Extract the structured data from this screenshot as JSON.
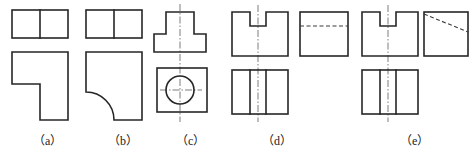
{
  "figure": {
    "background_color": "#ffffff",
    "line_colors": {
      "visible_edge": "#262626",
      "hidden_edge": "#3a3a3a",
      "center_line": "#6e6e6e",
      "label_text": "#1a1a1a"
    },
    "line_types": {
      "visible_edge": "solid thick",
      "hidden_edge": "dashed",
      "center_line": "dash-dot"
    }
  },
  "labels": [
    {
      "id": "a",
      "text": "（a）",
      "x": 33,
      "y": 131
    },
    {
      "id": "b",
      "text": "（b）",
      "x": 108,
      "y": 131
    },
    {
      "id": "c",
      "text": "（c）",
      "x": 176,
      "y": 131
    },
    {
      "id": "d",
      "text": "（d）",
      "x": 262,
      "y": 131
    },
    {
      "id": "e",
      "text": "（e）",
      "x": 400,
      "y": 131
    }
  ],
  "problems": [
    {
      "id": "a",
      "label": "（a）",
      "views": [
        {
          "name": "top-view",
          "shape": "rectangle-divided",
          "x": 12,
          "y": 10,
          "width": 56,
          "height": 28,
          "internal_lines": [
            {
              "type": "vertical",
              "at_x": 40
            }
          ]
        },
        {
          "name": "front-view",
          "shape": "L-shape-step",
          "outline_points": "12,52 68,52 68,120 40,120 40,84 12,84",
          "description": "L shaped profile with step notch at lower left"
        }
      ]
    },
    {
      "id": "b",
      "label": "（b）",
      "views": [
        {
          "name": "top-view",
          "shape": "rectangle-divided",
          "x": 86,
          "y": 10,
          "width": 56,
          "height": 28,
          "internal_lines": [
            {
              "type": "vertical",
              "at_x": 114
            }
          ]
        },
        {
          "name": "front-view",
          "shape": "L-shape-filleted",
          "description": "L shaped profile with concave quarter-round fillet replacing the inner corner",
          "fillet_radius": 28
        }
      ]
    },
    {
      "id": "c",
      "label": "（c）",
      "views": [
        {
          "name": "top-view",
          "shape": "T-shape",
          "description": "T shaped profile, narrow upper block on wide lower base",
          "upper_block": {
            "x": 166,
            "y": 12,
            "width": 28,
            "height": 22
          },
          "lower_base": {
            "x": 154,
            "y": 34,
            "width": 52,
            "height": 18
          }
        },
        {
          "name": "front-view",
          "shape": "rectangle-with-circle",
          "rect": {
            "x": 157,
            "y": 68,
            "width": 50,
            "height": 44
          },
          "circle": {
            "cx": 180,
            "cy": 90,
            "r": 14
          }
        }
      ],
      "center_lines": [
        {
          "type": "vertical",
          "at_x": 180,
          "from_y": 4,
          "to_y": 122
        },
        {
          "type": "horizontal",
          "at_y": 90,
          "from_x": 160,
          "to_x": 202
        }
      ]
    },
    {
      "id": "d",
      "label": "（d）",
      "views": [
        {
          "name": "top-view-notched",
          "shape": "rectangle-with-top-notch",
          "rect": {
            "x": 232,
            "y": 12,
            "width": 56,
            "height": 44
          },
          "notch": {
            "x": 250,
            "y": 12,
            "width": 16,
            "height": 14
          }
        },
        {
          "name": "front-view-double-line",
          "shape": "rectangle-divided",
          "rect": {
            "x": 232,
            "y": 70,
            "width": 56,
            "height": 44
          },
          "internal_lines": [
            {
              "type": "vertical",
              "at_x": 250
            },
            {
              "type": "vertical",
              "at_x": 266
            }
          ]
        },
        {
          "name": "side-view-dashed",
          "shape": "rectangle-with-horizontal-hidden-line",
          "rect": {
            "x": 300,
            "y": 12,
            "width": 48,
            "height": 44
          },
          "hidden_line": {
            "type": "horizontal",
            "at_y": 26
          }
        }
      ],
      "center_lines": [
        {
          "type": "vertical",
          "at_x": 258,
          "from_y": 5,
          "to_y": 122
        }
      ]
    },
    {
      "id": "e",
      "label": "（e）",
      "views": [
        {
          "name": "top-view-notched",
          "shape": "rectangle-with-top-notch",
          "rect": {
            "x": 362,
            "y": 12,
            "width": 56,
            "height": 44
          },
          "notch": {
            "x": 380,
            "y": 12,
            "width": 16,
            "height": 14
          }
        },
        {
          "name": "front-view-double-line",
          "shape": "rectangle-divided",
          "rect": {
            "x": 362,
            "y": 70,
            "width": 56,
            "height": 44
          },
          "internal_lines": [
            {
              "type": "vertical",
              "at_x": 380
            },
            {
              "type": "vertical",
              "at_x": 396
            }
          ]
        },
        {
          "name": "side-view-diagonal-dashed",
          "shape": "rectangle-with-diagonal-hidden-line",
          "rect": {
            "x": 424,
            "y": 12,
            "width": 44,
            "height": 44
          },
          "hidden_line": {
            "type": "diagonal",
            "from": "424,14",
            "to": "468,32"
          }
        }
      ],
      "center_lines": [
        {
          "type": "vertical",
          "at_x": 388,
          "from_y": 5,
          "to_y": 122
        }
      ]
    }
  ]
}
